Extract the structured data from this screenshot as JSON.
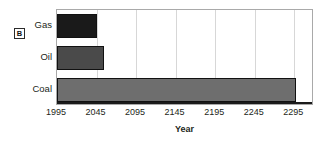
{
  "panel": {
    "badge_label": "B"
  },
  "chart_data": {
    "type": "bar",
    "orientation": "horizontal",
    "title": "",
    "subtitle": "",
    "xlabel": "Year",
    "ylabel": "",
    "categories": [
      "Gas",
      "Oil",
      "Coal"
    ],
    "values": [
      2045,
      2055,
      2297
    ],
    "xlim": [
      1995,
      2320
    ],
    "xticks": [
      1995,
      2045,
      2095,
      2145,
      2195,
      2245,
      2295
    ],
    "xticklabels": [
      "1995",
      "2045",
      "2095",
      "2145",
      "2195",
      "2245",
      "2295"
    ],
    "grid": true,
    "grid_axis": "x",
    "legend": false,
    "legend_position": "none",
    "bars": [
      {
        "category": "Gas",
        "value": 2045,
        "start": 1995,
        "color": "#1a1a1a",
        "edge_color": "#111111"
      },
      {
        "category": "Oil",
        "value": 2055,
        "start": 1995,
        "color": "#4a4a4a",
        "edge_color": "#111111"
      },
      {
        "category": "Coal",
        "value": 2297,
        "start": 1995,
        "color": "#6e6e6e",
        "edge_color": "#111111"
      }
    ],
    "colors": {
      "gas": "#1a1a1a",
      "oil": "#4a4a4a",
      "coal": "#6e6e6e",
      "grid": "#d7d7d7",
      "frame": "#a9a9a9",
      "axis": "#1b1b1b",
      "text": "#231f20",
      "background": "#ffffff"
    }
  }
}
